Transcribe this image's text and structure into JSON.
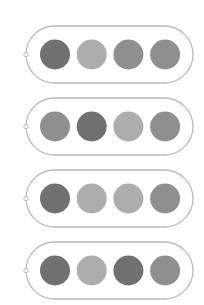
{
  "rows": [
    {
      "circles": [
        "dark",
        "light",
        "mid",
        "mid"
      ]
    },
    {
      "circles": [
        "mid",
        "dark",
        "light",
        "mid"
      ]
    },
    {
      "circles": [
        "dark",
        "light",
        "light",
        "mid"
      ]
    },
    {
      "circles": [
        "dark",
        "light",
        "dark",
        "mid"
      ]
    }
  ],
  "colors": {
    "dark": "#707070",
    "light": "#adadad",
    "mid": "#8f8f8f",
    "outline": "#b9b9b9",
    "background": "#ffffff"
  },
  "icons": {
    "connector": "open-circle-connector-icon"
  }
}
